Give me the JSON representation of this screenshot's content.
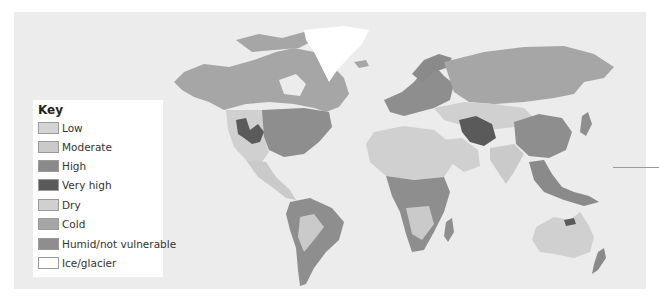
{
  "map": {
    "title": "World vulnerability map",
    "background": "#ececec"
  },
  "legend": {
    "title": "Key",
    "items": [
      {
        "label": "Low",
        "color": "#d4d4d4"
      },
      {
        "label": "Moderate",
        "color": "#cacaca"
      },
      {
        "label": "High",
        "color": "#8a8a8a"
      },
      {
        "label": "Very high",
        "color": "#5a5a5a"
      },
      {
        "label": "Dry",
        "color": "#d0d0d0"
      },
      {
        "label": "Cold",
        "color": "#a6a6a6"
      },
      {
        "label": "Humid/not vulnerable",
        "color": "#8e8e8e"
      },
      {
        "label": "Ice/glacier",
        "color": "#ffffff"
      }
    ]
  }
}
